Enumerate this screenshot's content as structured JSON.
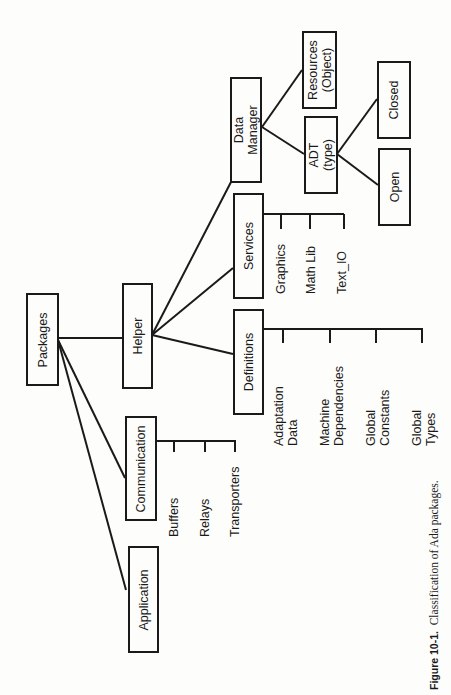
{
  "figure": {
    "caption_label": "Figure 10-1.",
    "caption_text": "Classification of Ada packages.",
    "orientation": "rotated 90° counter-clockwise"
  },
  "nodes": {
    "root": "Packages",
    "application": "Application",
    "communication": "Communication",
    "helper": "Helper",
    "definitions": "Definitions",
    "services": "Services",
    "data_manager": "Data\nManager",
    "resources": "Resources\n(Object)",
    "adt": "ADT\n(type)",
    "closed": "Closed",
    "open": "Open"
  },
  "leaves": {
    "communication": [
      "Buffers",
      "Relays",
      "Transporters"
    ],
    "definitions": [
      "Adaptation\nData",
      "Machine\nDependencies",
      "Global\nConstants",
      "Global\nTypes"
    ],
    "services": [
      "Graphics",
      "Math Lib",
      "Text_IO"
    ]
  },
  "tree": {
    "Packages": [
      "Application",
      "Communication",
      "Helper"
    ],
    "Communication": [
      "Buffers",
      "Relays",
      "Transporters"
    ],
    "Helper": [
      "Definitions",
      "Services",
      "Data Manager"
    ],
    "Definitions": [
      "Adaptation Data",
      "Machine Dependencies",
      "Global Constants",
      "Global Types"
    ],
    "Services": [
      "Graphics",
      "Math Lib",
      "Text_IO"
    ],
    "Data Manager": [
      "Resources (Object)",
      "ADT (type)"
    ],
    "ADT (type)": [
      "Closed",
      "Open"
    ]
  }
}
